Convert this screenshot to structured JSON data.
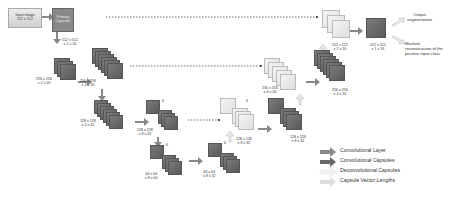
{
  "input_box": {
    "line1": "Input image",
    "line2": "512 x 512"
  },
  "primary_box": {
    "line1": "Primary",
    "line2": "Capsules"
  },
  "labels": {
    "primary_out": "512 x 512\nx 1 x 16",
    "enc1_a": "256 x 256\nx 2 x 16",
    "enc1_b": "256 x 256\nx 4 x 16",
    "enc2_a": "128 x 128\nx 4 x 32",
    "enc2_b": "128 x 128\nx 8 x 32",
    "enc3_a": "64 x 64\nx 8 x 64",
    "enc3_b": "64 x 64\nx 8 x 32",
    "dec1_a": "128 x 128\nx 8 x 32",
    "dec1_b": "128 x 128\nx 8 x 32",
    "dec2_a": "256 x 256\nx 4 x 16",
    "dec2_b": "256 x 256\nx 4 x 16",
    "dec3": "512 x 512\nx 2 x 16",
    "final": "512 x 512\nx 1 x 16",
    "count6": "6"
  },
  "outputs": {
    "segmentation": "Output\nsegmentation",
    "reconstruction": "Masked\nreconstruction of the\npositive input class"
  },
  "legend": {
    "items": [
      {
        "label": "Convolutional Layer",
        "color": "#8a8a8a"
      },
      {
        "label": "Convolutional Capsules",
        "color": "#6a6a6a"
      },
      {
        "label": "Deconvolutional Capsules",
        "color": "#f0f0f0"
      },
      {
        "label": "Capsule Vector Lengths",
        "color": "#d8d8d8"
      }
    ]
  }
}
